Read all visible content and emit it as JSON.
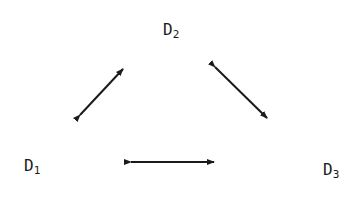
{
  "diagram": {
    "nodes": [
      {
        "id": "D2",
        "label": "D",
        "subscript": "2",
        "x": 163,
        "y": 22
      },
      {
        "id": "D1",
        "label": "D",
        "subscript": "1",
        "x": 24,
        "y": 158
      },
      {
        "id": "D3",
        "label": "D",
        "subscript": "3",
        "x": 323,
        "y": 162
      }
    ],
    "edges": [
      {
        "from": "D1",
        "to": "D2",
        "type": "bidirectional"
      },
      {
        "from": "D2",
        "to": "D3",
        "type": "bidirectional"
      },
      {
        "from": "D1",
        "to": "D3",
        "type": "bidirectional"
      }
    ],
    "colors": {
      "ink": "#1a1a1a",
      "background": "#ffffff"
    }
  }
}
